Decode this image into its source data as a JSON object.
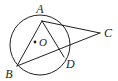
{
  "figure": {
    "name": "circle-with-inscribed-triangle",
    "background_color": "#ffffff",
    "stroke_color": "#231f20",
    "label_color": "#231f20",
    "stroke_width": 1
  },
  "circle": {
    "name": "circle-O",
    "center_x": 40,
    "center_y": 45,
    "radius": 30
  },
  "center_dot": {
    "name": "center-point-O",
    "x": 35,
    "y": 42,
    "radius": 1.4
  },
  "points": [
    {
      "id": "A",
      "label": "A",
      "x": 42,
      "y": 21,
      "label_x": 40,
      "label_y": 13,
      "on_circle": true
    },
    {
      "id": "B",
      "label": "B",
      "x": 17,
      "y": 66,
      "label_x": 9,
      "label_y": 78,
      "on_circle": true
    },
    {
      "id": "C",
      "label": "C",
      "x": 100,
      "y": 33,
      "label_x": 104,
      "label_y": 37,
      "on_circle": false
    },
    {
      "id": "D",
      "label": "D",
      "x": 64,
      "y": 57,
      "label_x": 66,
      "label_y": 68,
      "on_circle": true
    },
    {
      "id": "O",
      "label": "O",
      "x": 35,
      "y": 42,
      "label_x": 39,
      "label_y": 46,
      "on_circle": false
    }
  ],
  "segments": [
    {
      "id": "AB",
      "name": "chord-a-b",
      "x1": 42,
      "y1": 21,
      "x2": 17,
      "y2": 66
    },
    {
      "id": "AC",
      "name": "segment-a-c",
      "x1": 42,
      "y1": 21,
      "x2": 100,
      "y2": 33
    },
    {
      "id": "BC",
      "name": "segment-b-c",
      "x1": 17,
      "y1": 66,
      "x2": 100,
      "y2": 33
    },
    {
      "id": "AD",
      "name": "segment-a-d",
      "x1": 42,
      "y1": 21,
      "x2": 64,
      "y2": 57
    }
  ],
  "labels": {
    "A": "A",
    "B": "B",
    "C": "C",
    "D": "D",
    "O": "O"
  }
}
